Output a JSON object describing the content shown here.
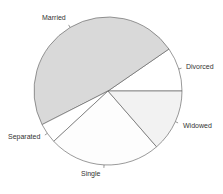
{
  "chart_data": {
    "type": "pie",
    "title": "",
    "categories": [
      "Divorced",
      "Married",
      "Separated",
      "Single",
      "Widowed"
    ],
    "values": [
      9.6,
      47.9,
      4.4,
      24.5,
      13.6
    ],
    "units": "percent (estimated from slice angles)",
    "start_angle_deg": 0,
    "direction": "counterclockwise",
    "colors": [
      "#ffffff",
      "#d9d9d9",
      "#ffffff",
      "#fdfdfd",
      "#f2f2f2"
    ],
    "legend": "none (slice labels)"
  },
  "labels": {
    "married": "Married",
    "divorced": "Divorced",
    "widowed": "Widowed",
    "single": "Single",
    "separated": "Separated"
  }
}
